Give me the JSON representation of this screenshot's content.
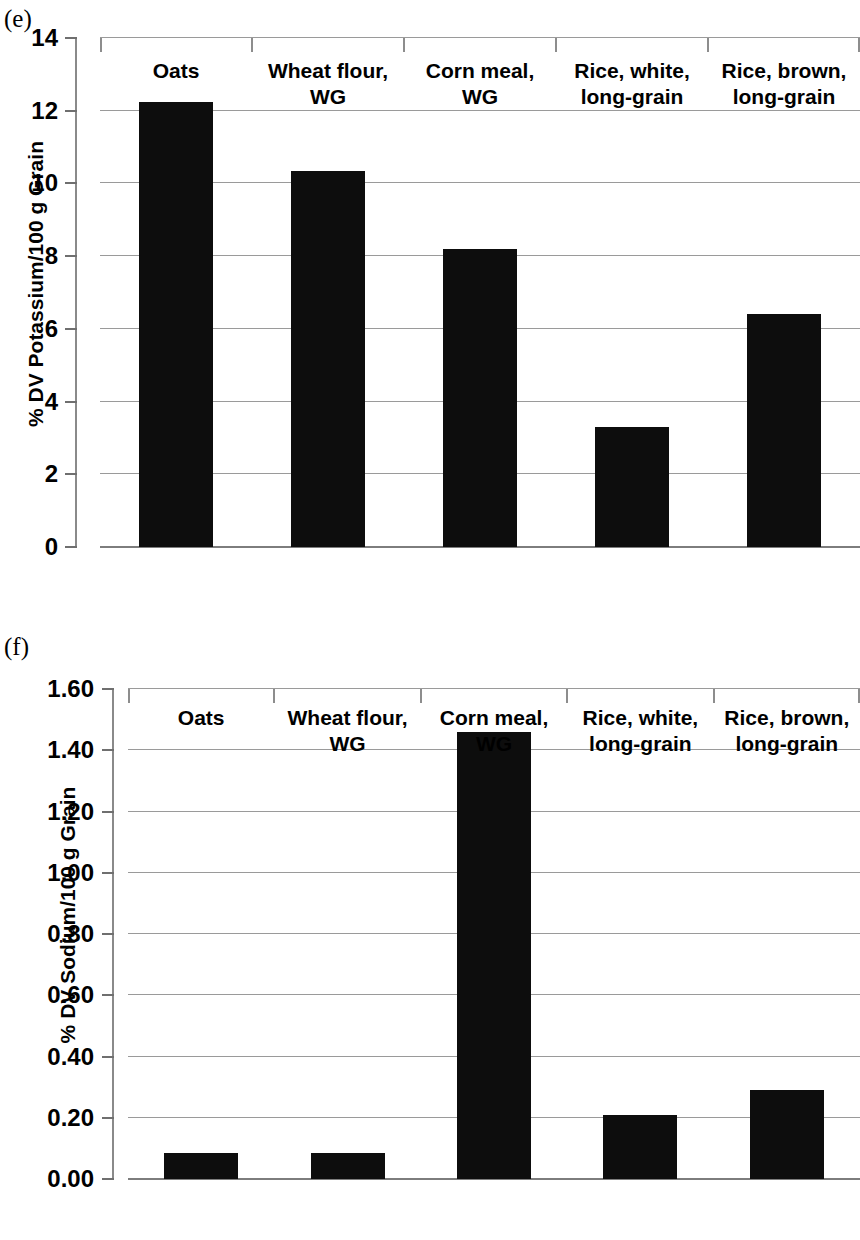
{
  "figure": {
    "panels": [
      {
        "letter": "(e)",
        "name": "potassium-chart"
      },
      {
        "letter": "(f)",
        "name": "sodium-chart"
      }
    ]
  },
  "chart_data": [
    {
      "type": "bar",
      "panel": "(e)",
      "title": "",
      "xlabel": "",
      "ylabel": "% DV Potassium/100 g Grain",
      "categories": [
        "Oats",
        "Wheat flour,\nWG",
        "Corn meal,\nWG",
        "Rice, white,\nlong-grain",
        "Rice, brown,\nlong-grain"
      ],
      "values": [
        12.25,
        10.35,
        8.2,
        3.3,
        6.4
      ],
      "ylim": [
        0,
        14
      ],
      "yticks": [
        0,
        2,
        4,
        6,
        8,
        10,
        12,
        14
      ],
      "ytick_labels": [
        "0",
        "2",
        "4",
        "6",
        "8",
        "10",
        "12",
        "14"
      ],
      "grid": true,
      "legend": "none",
      "bar_color": "#0d0d0d"
    },
    {
      "type": "bar",
      "panel": "(f)",
      "title": "",
      "xlabel": "",
      "ylabel": "% DV Sodium/100 g Grain",
      "categories": [
        "Oats",
        "Wheat flour,\nWG",
        "Corn meal,\nWG",
        "Rice, white,\nlong-grain",
        "Rice, brown,\nlong-grain"
      ],
      "values": [
        0.085,
        0.085,
        1.46,
        0.21,
        0.29
      ],
      "ylim": [
        0,
        1.6
      ],
      "yticks": [
        0.0,
        0.2,
        0.4,
        0.6,
        0.8,
        1.0,
        1.2,
        1.4,
        1.6
      ],
      "ytick_labels": [
        "0.00",
        "0.20",
        "0.40",
        "0.60",
        "0.80",
        "1.00",
        "1.20",
        "1.40",
        "1.60"
      ],
      "grid": true,
      "legend": "none",
      "bar_color": "#0d0d0d"
    }
  ]
}
